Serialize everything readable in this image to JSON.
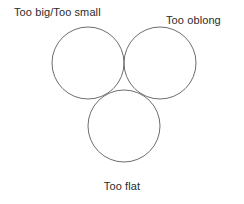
{
  "diagram": {
    "type": "venn",
    "set_count": 3,
    "background_color": "#ffffff",
    "stroke_color": "#6e6e70",
    "text_color": "#2b2b2b",
    "labels": {
      "top_left": "Too big/Too small",
      "top_right": "Too oblong",
      "bottom": "Too flat"
    },
    "circles": [
      {
        "name": "too-big-too-small",
        "cx": 88,
        "cy": 63,
        "r": 36
      },
      {
        "name": "too-oblong",
        "cx": 160,
        "cy": 63,
        "r": 36
      },
      {
        "name": "too-flat",
        "cx": 124,
        "cy": 126,
        "r": 36
      }
    ]
  }
}
